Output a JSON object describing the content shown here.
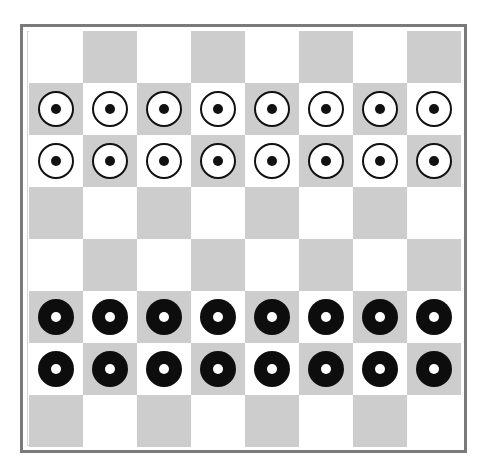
{
  "board": {
    "size": 8,
    "colors": {
      "light": "#ffffff",
      "dark": "#cdcdcd",
      "frame": "#7a7a7a",
      "piece_black": "#0d0d0d",
      "piece_white": "#ffffff"
    },
    "top_left_square": "light",
    "rows": [
      [
        "",
        "",
        "",
        "",
        "",
        "",
        "",
        ""
      ],
      [
        "white",
        "white",
        "white",
        "white",
        "white",
        "white",
        "white",
        "white"
      ],
      [
        "white",
        "white",
        "white",
        "white",
        "white",
        "white",
        "white",
        "white"
      ],
      [
        "",
        "",
        "",
        "",
        "",
        "",
        "",
        ""
      ],
      [
        "",
        "",
        "",
        "",
        "",
        "",
        "",
        ""
      ],
      [
        "black",
        "black",
        "black",
        "black",
        "black",
        "black",
        "black",
        "black"
      ],
      [
        "black",
        "black",
        "black",
        "black",
        "black",
        "black",
        "black",
        "black"
      ],
      [
        "",
        "",
        "",
        "",
        "",
        "",
        "",
        ""
      ]
    ]
  }
}
